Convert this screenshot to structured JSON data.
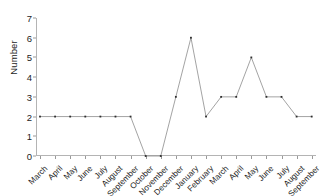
{
  "chart_data": {
    "type": "line",
    "title": "",
    "xlabel": "",
    "ylabel": "Number",
    "categories": [
      "March",
      "April",
      "May",
      "June",
      "July",
      "August",
      "September",
      "October",
      "November",
      "December",
      "January",
      "February",
      "March",
      "April",
      "May",
      "June",
      "July",
      "August",
      "September"
    ],
    "values": [
      2,
      2,
      2,
      2,
      2,
      2,
      2,
      0,
      0,
      3,
      6,
      2,
      3,
      3,
      5,
      3,
      3,
      2,
      2
    ],
    "ylim": [
      0,
      7
    ],
    "yticks": [
      0,
      1,
      2,
      3,
      4,
      5,
      6,
      7
    ],
    "ytick_labels": [
      "0",
      "1",
      "2",
      "3",
      "4",
      "5",
      "6",
      "7"
    ],
    "grid": false,
    "legend": null,
    "marker": "point",
    "line_color": "#8c8c8c",
    "marker_color": "#2e2e2e",
    "axis_color": "#b4b4b4"
  }
}
